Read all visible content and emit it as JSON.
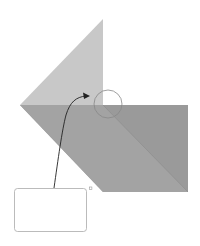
{
  "diagram": {
    "type": "origami-fold-instruction",
    "colors": {
      "background": "#ffffff",
      "top_flap": "#c8c8c8",
      "base_dark": "#9a9a9a",
      "base_lower_fold": "#a6a6a6",
      "fold_line": "#8c8c8c",
      "highlight_circle": "#888888",
      "arrow": "#222222",
      "callout_border": "#aaaaaa",
      "marker_dot": "#999999"
    },
    "callout": {
      "text": ""
    }
  }
}
